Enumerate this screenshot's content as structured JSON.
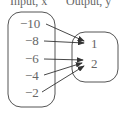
{
  "headers": {
    "input": "Input, x",
    "output": "Output, y"
  },
  "domain": [
    "−10",
    "−8",
    "−6",
    "−4",
    "−2"
  ],
  "range": [
    "1",
    "2"
  ],
  "mapping": [
    {
      "from": "−10",
      "to": "1"
    },
    {
      "from": "−8",
      "to": "1"
    },
    {
      "from": "−6",
      "to": "2"
    },
    {
      "from": "−4",
      "to": "2"
    },
    {
      "from": "−2",
      "to": "2"
    }
  ]
}
